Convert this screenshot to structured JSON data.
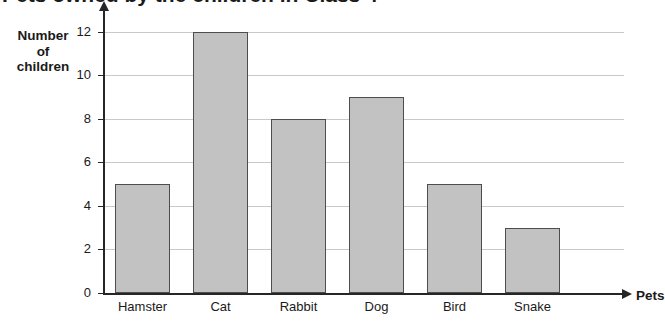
{
  "page": {
    "title_clipped": "Pets owned by the children in Class 4",
    "corner_marks": "✎ ✐ ✎"
  },
  "chart_data": {
    "type": "bar",
    "title": "Pets owned by the children in Class 4",
    "categories": [
      "Hamster",
      "Cat",
      "Rabbit",
      "Dog",
      "Bird",
      "Snake"
    ],
    "values": [
      5,
      12,
      8,
      9,
      5,
      3
    ],
    "xlabel": "Pets",
    "ylabel": "Number of children",
    "ylabel_lines": [
      "Number",
      "of",
      "children"
    ],
    "ylim": [
      0,
      13
    ],
    "yticks": [
      0,
      2,
      4,
      6,
      8,
      10,
      12
    ],
    "ytick_labels": [
      "0",
      "2",
      "4",
      "6",
      "8",
      "10",
      "12"
    ],
    "grid": true,
    "legend": "none",
    "bar_fill": "#c2c2c2",
    "bar_border": "#4d4d4d",
    "grid_color": "#c9c9c9",
    "axis_color": "#262626"
  }
}
